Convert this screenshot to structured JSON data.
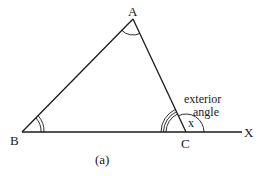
{
  "diagram": {
    "vertices": {
      "A": {
        "label": "A",
        "x": 133,
        "y": 19
      },
      "B": {
        "label": "B",
        "x": 22,
        "y": 132
      },
      "C": {
        "label": "C",
        "x": 186,
        "y": 132
      },
      "X": {
        "label": "X",
        "x": 242,
        "y": 132
      }
    },
    "angle_label": "x",
    "annotation_line1": "exterior",
    "annotation_line2": "angle",
    "caption": "(a)",
    "line_color": "#1a1a1a"
  }
}
